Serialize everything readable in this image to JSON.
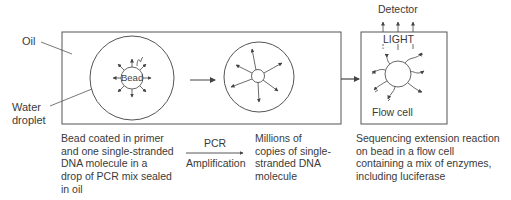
{
  "labels": {
    "oil": "Oil",
    "water_droplet_line1": "Water",
    "water_droplet_line2": "droplet",
    "bead": "Bead",
    "detector": "Detector",
    "light": "LIGHT",
    "flow_cell": "Flow cell",
    "pcr_top": "PCR",
    "pcr_bottom": "Amplification"
  },
  "captions": {
    "step1": "Bead coated in primer\nand one single-stranded\nDNA molecule in a\ndrop of PCR mix sealed\nin oil",
    "step2": "Millions of\ncopies of single-\nstranded DNA\nmolecule",
    "step3": "Sequencing extension reaction\non bead in a flow cell\ncontaining a mix of enzymes,\nincluding luciferase"
  },
  "colors": {
    "stroke": "#555555",
    "text": "#3a3a3a"
  }
}
